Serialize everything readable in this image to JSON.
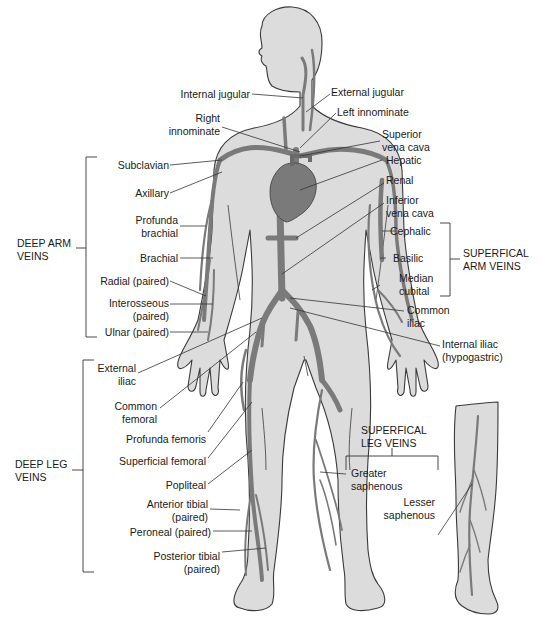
{
  "figure": {
    "type": "anatomical-diagram",
    "colors": {
      "skin": "#dcdcdc",
      "outline": "#3a3a3a",
      "vein": "#7a7a7a",
      "leader": "#333333",
      "background": "#ffffff"
    }
  },
  "groups": {
    "deep_arm": {
      "line1": "DEEP ARM",
      "line2": "VEINS"
    },
    "superficial_arm": {
      "line1": "SUPERFICAL",
      "line2": "ARM VEINS"
    },
    "deep_leg": {
      "line1": "DEEP LEG",
      "line2": "VEINS"
    },
    "superficial_leg": {
      "line1": "SUPERFICAL",
      "line2": "LEG VEINS"
    }
  },
  "labels": {
    "internal_jugular": "Internal jugular",
    "external_jugular": "External jugular",
    "right_innominate_1": "Right",
    "right_innominate_2": "innominate",
    "left_innominate": "Left innominate",
    "superior_vena_cava_1": "Superior",
    "superior_vena_cava_2": "vena cava",
    "subclavian": "Subclavian",
    "hepatic": "Hepatic",
    "axillary": "Axillary",
    "renal": "Renal",
    "inferior_vena_cava_1": "Inferior",
    "inferior_vena_cava_2": "vena cava",
    "profunda_brachial_1": "Profunda",
    "profunda_brachial_2": "brachial",
    "cephalic": "Cephalic",
    "brachial": "Brachial",
    "basilic": "Basilic",
    "radial": "Radial (paired)",
    "median_cubital_1": "Median",
    "median_cubital_2": "cubital",
    "interosseous_1": "Interosseous",
    "interosseous_2": "(paired)",
    "ulnar": "Ulnar (paired)",
    "common_iliac_1": "Common",
    "common_iliac_2": "iliac",
    "internal_iliac_1": "Internal iliac",
    "internal_iliac_2": "(hypogastric)",
    "external_iliac_1": "External",
    "external_iliac_2": "iliac",
    "common_femoral_1": "Common",
    "common_femoral_2": "femoral",
    "profunda_femoris": "Profunda femoris",
    "superficial_femoral": "Superficial femoral",
    "popliteal": "Popliteal",
    "greater_saphenous_1": "Greater",
    "greater_saphenous_2": "saphenous",
    "lesser_saphenous_1": "Lesser",
    "lesser_saphenous_2": "saphenous",
    "anterior_tibial_1": "Anterior tibial",
    "anterior_tibial_2": "(paired)",
    "peroneal": "Peroneal (paired)",
    "posterior_tibial_1": "Posterior tibial",
    "posterior_tibial_2": "(paired)"
  }
}
